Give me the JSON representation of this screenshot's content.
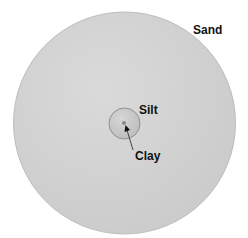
{
  "diagram": {
    "type": "particle-size-comparison",
    "labels": {
      "sand": "Sand",
      "silt": "Silt",
      "clay": "Clay"
    },
    "particles": [
      {
        "name": "Sand",
        "cx": 124.5,
        "cy": 123,
        "r": 111,
        "fill": "#d2d2d2",
        "stroke": "#b8b8b8"
      },
      {
        "name": "Silt",
        "cx": 124.5,
        "cy": 123.5,
        "r": 15.5,
        "fill": "#c9c9c9",
        "stroke": "#8f8f8f"
      },
      {
        "name": "Clay",
        "cx": 124,
        "cy": 123,
        "r": 2,
        "fill": "#8a8a8a",
        "stroke": "#777777"
      }
    ],
    "colors": {
      "background": "#ffffff",
      "text": "#111111",
      "arrow": "#333333"
    }
  }
}
